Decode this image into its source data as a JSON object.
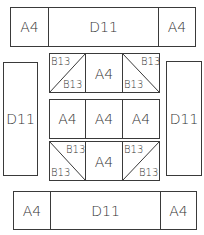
{
  "diagram": {
    "title": "",
    "top_bar": {
      "left": "A4",
      "center": "D11",
      "right": "A4"
    },
    "left_side": "D11",
    "right_side": "D11",
    "grid": {
      "row1": [
        {
          "type": "split",
          "diagonal": "tl-br-reverse",
          "top": "B13",
          "bottom": "B13"
        },
        {
          "type": "full",
          "label": "A4"
        },
        {
          "type": "split",
          "diagonal": "tl-br",
          "top": "B13",
          "bottom": "B13"
        }
      ],
      "row2": [
        {
          "type": "full",
          "label": "A4"
        },
        {
          "type": "full",
          "label": "A4"
        },
        {
          "type": "full",
          "label": "A4"
        }
      ],
      "row3": [
        {
          "type": "split",
          "diagonal": "tl-br",
          "top": "B13",
          "bottom": "B13"
        },
        {
          "type": "full",
          "label": "A4"
        },
        {
          "type": "split",
          "diagonal": "tl-br-reverse",
          "top": "B13",
          "bottom": "B13"
        }
      ]
    },
    "bottom_bar": {
      "left": "A4",
      "center": "D11",
      "right": "A4"
    },
    "stroke_color": "#3a3a3a"
  }
}
